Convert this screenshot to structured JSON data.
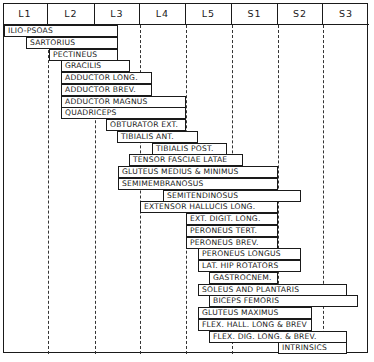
{
  "header": {
    "segments": [
      "L1",
      "L2",
      "L3",
      "L4",
      "L5",
      "S1",
      "S2",
      "S3"
    ]
  },
  "chart_data": {
    "type": "table",
    "title": "",
    "columns": [
      "L1",
      "L2",
      "L3",
      "L4",
      "L5",
      "S1",
      "S2",
      "S3"
    ],
    "column_edges_px": [
      3,
      48,
      95,
      140,
      186,
      232,
      278,
      323,
      369
    ],
    "rows": [
      {
        "label": "ILIO-PSOAS",
        "start": 0.0,
        "end": 2.5
      },
      {
        "label": "SARTORIUS",
        "start": 0.5,
        "end": 2.5
      },
      {
        "label": "PECTINEUS",
        "start": 1.0,
        "end": 2.5
      },
      {
        "label": "GRACILIS",
        "start": 1.25,
        "end": 2.75
      },
      {
        "label": "ADDUCTOR LONG.",
        "start": 1.25,
        "end": 3.25
      },
      {
        "label": "ADDUCTOR BREV.",
        "start": 1.25,
        "end": 3.25
      },
      {
        "label": "ADDUCTOR MAGNUS",
        "start": 1.25,
        "end": 4.0
      },
      {
        "label": "QUADRICEPS",
        "start": 1.25,
        "end": 4.0
      },
      {
        "label": "OBTURATOR EXT.",
        "start": 2.25,
        "end": 4.0
      },
      {
        "label": "TIBIALIS ANT.",
        "start": 2.5,
        "end": 4.25
      },
      {
        "label": "TIBIALIS POST.",
        "start": 3.25,
        "end": 4.9
      },
      {
        "label": "TENSOR FASCIAE LATAE",
        "start": 2.75,
        "end": 5.25
      },
      {
        "label": "GLUTEUS MEDIUS & MINIMUS",
        "start": 2.5,
        "end": 6.0
      },
      {
        "label": "SEMIMEMBRANOSUS",
        "start": 2.5,
        "end": 6.0
      },
      {
        "label": "SEMITENDINOSUS",
        "start": 3.5,
        "end": 6.5
      },
      {
        "label": "EXTENSOR HALLUCIS LONG.",
        "start": 3.0,
        "end": 6.0
      },
      {
        "label": "EXT. DIGIT. LONG.",
        "start": 4.0,
        "end": 6.0
      },
      {
        "label": "PERONEUS TERT.",
        "start": 4.0,
        "end": 6.0
      },
      {
        "label": "PERONEUS BREV.",
        "start": 4.0,
        "end": 6.0
      },
      {
        "label": "PERONEUS LONGUS",
        "start": 4.25,
        "end": 6.5
      },
      {
        "label": "LAT. HIP ROTATORS",
        "start": 4.25,
        "end": 6.5
      },
      {
        "label": "GASTROCNEM.",
        "start": 4.5,
        "end": 6.0
      },
      {
        "label": "SOLEUS AND PLANTARIS",
        "start": 4.25,
        "end": 7.5
      },
      {
        "label": "BICEPS FEMORIS",
        "start": 4.5,
        "end": 7.75
      },
      {
        "label": "GLUTEUS MAXIMUS",
        "start": 4.25,
        "end": 6.75
      },
      {
        "label": "FLEX. HALL. LONG & BREV",
        "start": 4.25,
        "end": 6.75
      },
      {
        "label": "FLEX. DIG. LONG. & BREV.",
        "start": 4.5,
        "end": 7.5
      },
      {
        "label": "INTRINSICS",
        "start": 6.0,
        "end": 7.5
      }
    ],
    "xlabel": "Spinal segments",
    "ylabel": "Muscles"
  },
  "bars_px": [
    {
      "x1": 4,
      "x2": 118
    },
    {
      "x1": 26,
      "x2": 118
    },
    {
      "x1": 49,
      "x2": 118
    },
    {
      "x1": 61,
      "x2": 130
    },
    {
      "x1": 61,
      "x2": 152
    },
    {
      "x1": 61,
      "x2": 152
    },
    {
      "x1": 61,
      "x2": 186
    },
    {
      "x1": 61,
      "x2": 186
    },
    {
      "x1": 106,
      "x2": 186
    },
    {
      "x1": 117,
      "x2": 198
    },
    {
      "x1": 152,
      "x2": 227
    },
    {
      "x1": 129,
      "x2": 243
    },
    {
      "x1": 118,
      "x2": 278
    },
    {
      "x1": 118,
      "x2": 278
    },
    {
      "x1": 163,
      "x2": 301
    },
    {
      "x1": 140,
      "x2": 278
    },
    {
      "x1": 186,
      "x2": 278
    },
    {
      "x1": 186,
      "x2": 278
    },
    {
      "x1": 186,
      "x2": 278
    },
    {
      "x1": 198,
      "x2": 301
    },
    {
      "x1": 198,
      "x2": 301
    },
    {
      "x1": 209,
      "x2": 278
    },
    {
      "x1": 198,
      "x2": 347
    },
    {
      "x1": 209,
      "x2": 358
    },
    {
      "x1": 198,
      "x2": 312
    },
    {
      "x1": 198,
      "x2": 312
    },
    {
      "x1": 209,
      "x2": 347
    },
    {
      "x1": 278,
      "x2": 347
    }
  ]
}
